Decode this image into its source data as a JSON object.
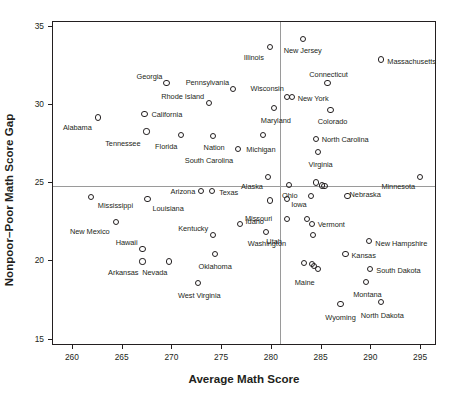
{
  "chart_data": {
    "type": "scatter",
    "title": "",
    "xlabel": "Average Math Score",
    "ylabel": "Nonpoor–Poor Math Score Gap",
    "xlim": [
      258.0,
      296.6
    ],
    "ylim": [
      14.6,
      35.3
    ],
    "xticks": [
      260,
      265,
      270,
      275,
      280,
      285,
      290,
      295
    ],
    "yticks": [
      15,
      20,
      25,
      30,
      35
    ],
    "xtick_labels": [
      "260",
      "265",
      "270",
      "275",
      "280",
      "285",
      "290",
      "295"
    ],
    "ytick_labels": [
      "15",
      "20",
      "25",
      "30",
      "35"
    ],
    "grid": false,
    "legend": "none",
    "reference_lines": [
      {
        "orientation": "vertical",
        "value": 280.8,
        "color": "#9a9a9a"
      },
      {
        "orientation": "horizontal",
        "value": 24.8,
        "color": "#9a9a9a"
      }
    ],
    "marker": {
      "shape": "circle",
      "filled": false,
      "edge_color": "#231f20",
      "size": 6
    },
    "points": [
      {
        "label": "Mississippi",
        "x": 261.8,
        "y": 24.1,
        "lx": 7,
        "ly": 9,
        "anchor": "start"
      },
      {
        "label": "Alabama",
        "x": 262.5,
        "y": 29.2,
        "lx": -6,
        "ly": 11,
        "anchor": "end"
      },
      {
        "label": "New Mexico",
        "x": 264.3,
        "y": 22.5,
        "lx": -6,
        "ly": 10,
        "anchor": "end"
      },
      {
        "label": "California",
        "x": 267.2,
        "y": 29.4,
        "lx": 7,
        "ly": 1,
        "anchor": "start"
      },
      {
        "label": "Tennessee",
        "x": 267.4,
        "y": 28.3,
        "lx": -6,
        "ly": 12,
        "anchor": "end"
      },
      {
        "label": "Louisiana",
        "x": 267.5,
        "y": 24.0,
        "lx": 5,
        "ly": 10,
        "anchor": "start"
      },
      {
        "label": "Hawaii",
        "x": 267.0,
        "y": 20.8,
        "lx": -5,
        "ly": -6,
        "anchor": "end"
      },
      {
        "label": "Arkansas",
        "x": 267.0,
        "y": 20.0,
        "lx": -4,
        "ly": 12,
        "anchor": "end"
      },
      {
        "label": "Georgia",
        "x": 269.4,
        "y": 31.4,
        "lx": -4,
        "ly": -6,
        "anchor": "end"
      },
      {
        "label": "Nevada",
        "x": 269.7,
        "y": 20.0,
        "lx": -2,
        "ly": 12,
        "anchor": "end"
      },
      {
        "label": "Florida",
        "x": 270.9,
        "y": 28.1,
        "lx": -4,
        "ly": 12,
        "anchor": "end"
      },
      {
        "label": "Arizona",
        "x": 272.9,
        "y": 24.5,
        "lx": -6,
        "ly": 1,
        "anchor": "end"
      },
      {
        "label": "West Virginia",
        "x": 272.6,
        "y": 18.6,
        "lx": 1,
        "ly": 13,
        "anchor": "middle"
      },
      {
        "label": "Rhode Island",
        "x": 273.7,
        "y": 30.1,
        "lx": -5,
        "ly": -6,
        "anchor": "end"
      },
      {
        "label": "Kentucky",
        "x": 274.1,
        "y": 21.7,
        "lx": -5,
        "ly": -6,
        "anchor": "end"
      },
      {
        "label": "Texas",
        "x": 274.0,
        "y": 24.5,
        "lx": 7,
        "ly": 2,
        "anchor": "start"
      },
      {
        "label": "Nation",
        "x": 274.1,
        "y": 28.0,
        "lx": 1,
        "ly": 12,
        "anchor": "middle"
      },
      {
        "label": "Pennsylvania",
        "x": 276.1,
        "y": 31.0,
        "lx": -4,
        "ly": -6,
        "anchor": "end"
      },
      {
        "label": "Oklahoma",
        "x": 274.3,
        "y": 20.5,
        "lx": 0,
        "ly": 13,
        "anchor": "middle"
      },
      {
        "label": "Missouri",
        "x": 276.8,
        "y": 22.4,
        "lx": 5,
        "ly": -5,
        "anchor": "start"
      },
      {
        "label": "South Carolina",
        "x": 276.6,
        "y": 27.2,
        "lx": -5,
        "ly": 12,
        "anchor": "end"
      },
      {
        "label": "Michigan",
        "x": 279.1,
        "y": 28.1,
        "lx": -2,
        "ly": 15,
        "anchor": "middle"
      },
      {
        "label": "Illinois",
        "x": 279.8,
        "y": 33.7,
        "lx": -6,
        "ly": 11,
        "anchor": "end"
      },
      {
        "label": "Alaska",
        "x": 279.6,
        "y": 25.4,
        "lx": -5,
        "ly": 10,
        "anchor": "end"
      },
      {
        "label": "Washington",
        "x": 279.4,
        "y": 21.9,
        "lx": 1,
        "ly": 12,
        "anchor": "middle"
      },
      {
        "label": "Idaho",
        "x": 279.8,
        "y": 23.9,
        "lx": -6,
        "ly": 22,
        "anchor": "end"
      },
      {
        "label": "Maryland",
        "x": 280.2,
        "y": 29.8,
        "lx": 2,
        "ly": 13,
        "anchor": "middle"
      },
      {
        "label": "Wisconsin",
        "x": 281.5,
        "y": 30.5,
        "lx": -3,
        "ly": -8,
        "anchor": "end"
      },
      {
        "label": "Ohio",
        "x": 281.7,
        "y": 24.9,
        "lx": 1,
        "ly": 11,
        "anchor": "middle"
      },
      {
        "label": "Utah",
        "x": 281.5,
        "y": 22.7,
        "lx": -5,
        "ly": 23,
        "anchor": "end"
      },
      {
        "label": "New York",
        "x": 282.0,
        "y": 30.5,
        "lx": 6,
        "ly": 2,
        "anchor": "start"
      },
      {
        "label": "New Jersey",
        "x": 283.1,
        "y": 34.2,
        "lx": 0,
        "ly": 12,
        "anchor": "middle"
      },
      {
        "label": "Iowa",
        "x": 283.9,
        "y": 24.2,
        "lx": -4,
        "ly": 9,
        "anchor": "end"
      },
      {
        "label": "Vermont",
        "x": 284.0,
        "y": 22.4,
        "lx": 6,
        "ly": 1,
        "anchor": "start"
      },
      {
        "label": "North Carolina",
        "x": 284.4,
        "y": 27.8,
        "lx": 6,
        "ly": 1,
        "anchor": "start"
      },
      {
        "label": "Virginia",
        "x": 284.6,
        "y": 27.0,
        "lx": 3,
        "ly": 13,
        "anchor": "middle"
      },
      {
        "label": "Maine",
        "x": 284.6,
        "y": 19.5,
        "lx": -3,
        "ly": 14,
        "anchor": "end"
      },
      {
        "label": "Connecticut",
        "x": 285.6,
        "y": 31.4,
        "lx": 1,
        "ly": -8,
        "anchor": "middle"
      },
      {
        "label": "Kansas",
        "x": 287.4,
        "y": 20.5,
        "lx": 6,
        "ly": 2,
        "anchor": "start"
      },
      {
        "label": "Colorado",
        "x": 285.9,
        "y": 29.7,
        "lx": 2,
        "ly": 12,
        "anchor": "middle"
      },
      {
        "label": "Wyoming",
        "x": 286.9,
        "y": 17.3,
        "lx": 0,
        "ly": 14,
        "anchor": "middle"
      },
      {
        "label": "Nebraska",
        "x": 285.3,
        "y": 24.8,
        "lx": 25,
        "ly": 9,
        "anchor": "start"
      },
      {
        "label": "New Hampshire",
        "x": 289.8,
        "y": 21.3,
        "lx": 6,
        "ly": 3,
        "anchor": "start"
      },
      {
        "label": "South Dakota",
        "x": 289.9,
        "y": 19.5,
        "lx": 6,
        "ly": 2,
        "anchor": "start"
      },
      {
        "label": "Montana",
        "x": 289.5,
        "y": 18.7,
        "lx": 1,
        "ly": 13,
        "anchor": "middle"
      },
      {
        "label": "Massachusetts",
        "x": 291.0,
        "y": 32.9,
        "lx": 6,
        "ly": 2,
        "anchor": "start"
      },
      {
        "label": "North Dakota",
        "x": 291.0,
        "y": 17.4,
        "lx": 1,
        "ly": 14,
        "anchor": "middle"
      },
      {
        "label": "Minnesota",
        "x": 294.9,
        "y": 25.4,
        "lx": -5,
        "ly": 10,
        "anchor": "end"
      }
    ],
    "unlabeled_points": [
      {
        "x": 281.5,
        "y": 24.0
      },
      {
        "x": 283.2,
        "y": 19.9
      },
      {
        "x": 284.0,
        "y": 19.85
      },
      {
        "x": 284.2,
        "y": 19.7
      },
      {
        "x": 284.4,
        "y": 25.05
      },
      {
        "x": 285.0,
        "y": 24.85
      },
      {
        "x": 284.1,
        "y": 21.7
      },
      {
        "x": 287.6,
        "y": 24.2
      },
      {
        "x": 283.5,
        "y": 22.7
      }
    ]
  }
}
